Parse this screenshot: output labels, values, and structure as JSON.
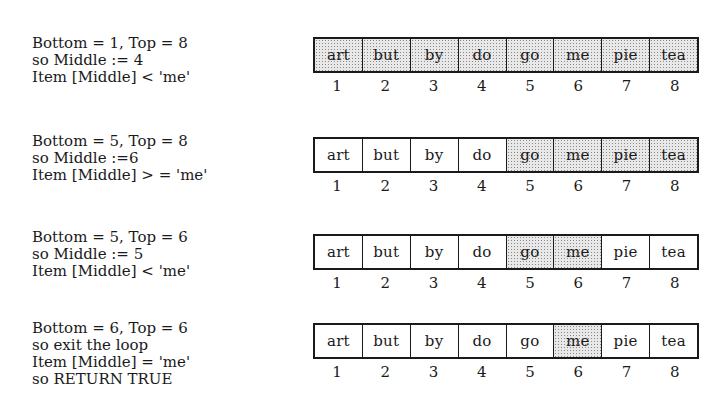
{
  "diagram": {
    "type": "binary-search-trace",
    "target": "me",
    "items": [
      "art",
      "but",
      "by",
      "do",
      "go",
      "me",
      "pie",
      "tea"
    ],
    "indices": [
      "1",
      "2",
      "3",
      "4",
      "5",
      "6",
      "7",
      "8"
    ],
    "colors": {
      "line": "#1a1a1a",
      "shade": "#e8e8e8",
      "background": "#ffffff"
    },
    "steps": [
      {
        "lines": [
          "Bottom = 1, Top = 8",
          "so Middle := 4",
          "Item [Middle] < 'me'"
        ],
        "shaded": [
          true,
          true,
          true,
          true,
          true,
          true,
          true,
          true
        ]
      },
      {
        "lines": [
          "Bottom = 5, Top = 8",
          "so Middle :=6",
          "Item [Middle] > = 'me'"
        ],
        "shaded": [
          false,
          false,
          false,
          false,
          true,
          true,
          true,
          true
        ]
      },
      {
        "lines": [
          "Bottom = 5, Top = 6",
          "so Middle := 5",
          "Item [Middle] < 'me'"
        ],
        "shaded": [
          false,
          false,
          false,
          false,
          true,
          true,
          false,
          false
        ]
      },
      {
        "lines": [
          "Bottom = 6, Top = 6",
          "so exit the loop",
          "Item [Middle] = 'me'",
          "so RETURN TRUE"
        ],
        "shaded": [
          false,
          false,
          false,
          false,
          false,
          true,
          false,
          false
        ]
      }
    ]
  }
}
